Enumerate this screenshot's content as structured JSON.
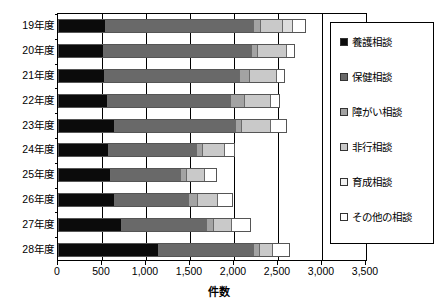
{
  "chart_data": {
    "type": "bar",
    "orientation": "horizontal",
    "stacked": true,
    "title": "",
    "xlabel": "件数",
    "ylabel": "",
    "xlim": [
      0,
      3500
    ],
    "xticks": [
      0,
      500,
      1000,
      1500,
      2000,
      2500,
      3000,
      3500
    ],
    "xtick_labels": [
      "0",
      "500",
      "1,000",
      "1,500",
      "2,000",
      "2,500",
      "3,000",
      "3,500"
    ],
    "grid": true,
    "legend_position": "right",
    "categories": [
      "19年度",
      "20年度",
      "21年度",
      "22年度",
      "23年度",
      "24年度",
      "25年度",
      "26年度",
      "27年度",
      "28年度"
    ],
    "series": [
      {
        "name": "養護相談",
        "color": "#0b0b0b",
        "values": [
          520,
          500,
          510,
          540,
          620,
          560,
          580,
          630,
          710,
          1130
        ]
      },
      {
        "name": "保健相談",
        "color": "#696969",
        "values": [
          1680,
          1680,
          1530,
          1400,
          1380,
          1000,
          790,
          840,
          960,
          1070
        ]
      },
      {
        "name": "障がい相談",
        "color": "#a3a3a3",
        "values": [
          80,
          70,
          120,
          160,
          70,
          60,
          70,
          100,
          80,
          70
        ]
      },
      {
        "name": "非行相談",
        "color": "#c9c9c9",
        "values": [
          260,
          330,
          310,
          300,
          330,
          250,
          210,
          220,
          200,
          150
        ]
      },
      {
        "name": "育成相談",
        "color": "#dddddd",
        "values": [
          110,
          0,
          0,
          0,
          0,
          0,
          0,
          0,
          0,
          0
        ]
      },
      {
        "name": "その他の相談",
        "color": "#ffffff",
        "values": [
          150,
          90,
          90,
          100,
          180,
          120,
          130,
          180,
          220,
          190
        ]
      }
    ],
    "totals": [
      2800,
      2670,
      2560,
      2500,
      2580,
      1990,
      1780,
      1970,
      2170,
      2610
    ]
  },
  "legend": {
    "items": [
      {
        "label": "養護相談",
        "swatch": "legend-swatch-yogo"
      },
      {
        "label": "保健相談",
        "swatch": "legend-swatch-hoken"
      },
      {
        "label": "障がい相談",
        "swatch": "legend-swatch-shogai"
      },
      {
        "label": "非行相談",
        "swatch": "legend-swatch-hiko"
      },
      {
        "label": "育成相談",
        "swatch": "legend-swatch-ikusei"
      },
      {
        "label": "その他の相談",
        "swatch": "legend-swatch-sonota"
      }
    ]
  },
  "axis": {
    "x_title": "件数"
  }
}
